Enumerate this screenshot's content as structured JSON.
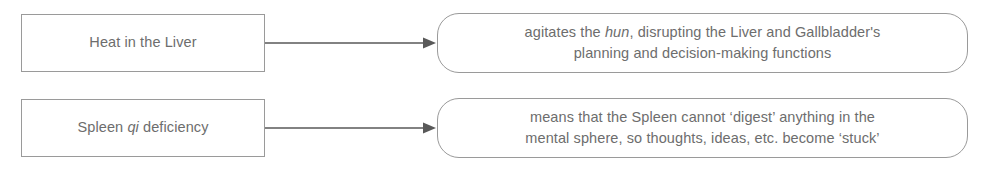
{
  "diagram": {
    "type": "flow",
    "background_color": "#ffffff",
    "text_color": "#6d6d6d",
    "line_color": "#9a9a9a",
    "arrow_color": "#595959",
    "rows": [
      {
        "cause": {
          "text_before_italic": "Heat in the Liver",
          "italic": "",
          "text_after_italic": "",
          "full_text": "Heat in the Liver",
          "shape": "rectangle"
        },
        "connector": {
          "type": "arrow",
          "direction": "right"
        },
        "effect": {
          "line1_before_italic": "agitates the ",
          "line1_italic": "hun",
          "line1_after_italic": ", disrupting the Liver and Gallbladder's",
          "line2": "planning and decision-making functions",
          "full_text": "agitates the hun, disrupting the Liver and Gallbladder's planning and decision-making functions",
          "shape": "rounded-rectangle"
        }
      },
      {
        "cause": {
          "text_before_italic": "Spleen ",
          "italic": "qi",
          "text_after_italic": " deficiency",
          "full_text": "Spleen qi deficiency",
          "shape": "rectangle"
        },
        "connector": {
          "type": "arrow",
          "direction": "right"
        },
        "effect": {
          "line1_before_italic": "means that the Spleen cannot ‘digest’ anything in the",
          "line1_italic": "",
          "line1_after_italic": "",
          "line2": "mental sphere, so thoughts, ideas, etc. become ‘stuck’",
          "full_text": "means that the Spleen cannot ‘digest’ anything in the mental sphere, so thoughts, ideas, etc. become ‘stuck’",
          "shape": "rounded-rectangle"
        }
      }
    ]
  }
}
